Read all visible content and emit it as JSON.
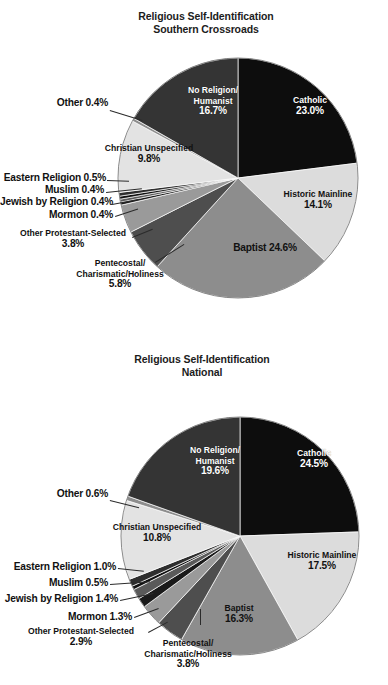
{
  "page": {
    "background": "#ffffff",
    "width": 388,
    "height": 685
  },
  "palette": {
    "catholic": "#0d0d0d",
    "historic_mainline": "#dcdcdc",
    "baptist": "#8d8d8d",
    "pentecostal": "#4e4e4e",
    "other_protestant": "#9a9a9a",
    "mormon": "#1a1a1a",
    "jewish": "#5a5a5a",
    "muslim": "#111111",
    "eastern": "#2e2e2e",
    "christian_unspecified": "#e3e3e3",
    "other": "#8d8d8d",
    "no_religion": "#343434",
    "text": "#111111",
    "leader_line": "#2b2b2b"
  },
  "charts": [
    {
      "id": "southern-crossroads",
      "title_line1": "Religious Self-Identification",
      "title_line2": "Southern Crossroads",
      "slices": [
        {
          "key": "catholic",
          "label": "Catholic",
          "value_text": "23.0%",
          "value": 23.0
        },
        {
          "key": "historic_mainline",
          "label": "Historic Mainline",
          "value_text": "14.1%",
          "value": 14.1
        },
        {
          "key": "baptist",
          "label": "Baptist",
          "value_text": "24.6%",
          "value": 24.6
        },
        {
          "key": "pentecostal",
          "label": "Pentecostal/ Charismatic/Holiness",
          "value_text": "5.8%",
          "value": 5.8
        },
        {
          "key": "other_protestant",
          "label": "Other Protestant-Selected",
          "value_text": "3.8%",
          "value": 3.8
        },
        {
          "key": "mormon",
          "label": "Mormon",
          "value_text": "0.4%",
          "value": 0.4
        },
        {
          "key": "jewish",
          "label": "Jewish by Religion",
          "value_text": "0.4%",
          "value": 0.4
        },
        {
          "key": "muslim",
          "label": "Muslim",
          "value_text": "0.4%",
          "value": 0.4
        },
        {
          "key": "eastern",
          "label": "Eastern Religion",
          "value_text": "0.5%",
          "value": 0.5
        },
        {
          "key": "christian_unspecified",
          "label": "Christian Unspecified",
          "value_text": "9.8%",
          "value": 9.8
        },
        {
          "key": "other",
          "label": "Other",
          "value_text": "0.4%",
          "value": 0.4
        },
        {
          "key": "no_religion",
          "label": "No Religion/ Humanist",
          "value_text": "16.7%",
          "value": 16.7
        }
      ],
      "labels": {
        "catholic_l1": "Catholic",
        "catholic_l2": "23.0%",
        "historic_l1": "Historic Mainline",
        "historic_l2": "14.1%",
        "baptist_inline": "Baptist 24.6%",
        "noreligion_l1": "No Religion/",
        "noreligion_l2": "Humanist",
        "noreligion_l3": "16.7%",
        "christian_l1": "Christian Unspecified",
        "christian_l2": "9.8%",
        "other_inline": "Other 0.4%",
        "eastern_inline": "Eastern Religion 0.5%",
        "muslim_inline": "Muslim 0.4%",
        "jewish_inline": "Jewish by Religion 0.4%",
        "mormon_inline": "Mormon 0.4%",
        "otherprot_l1": "Other Protestant-Selected",
        "otherprot_l2": "3.8%",
        "pentecostal_l1": "Pentecostal/",
        "pentecostal_l2": "Charismatic/Holiness",
        "pentecostal_l3": "5.8%"
      }
    },
    {
      "id": "national",
      "title_line1": "Religious Self-Identification",
      "title_line2": "National",
      "slices": [
        {
          "key": "catholic",
          "label": "Catholic",
          "value_text": "24.5%",
          "value": 24.5
        },
        {
          "key": "historic_mainline",
          "label": "Historic Mainline",
          "value_text": "17.5%",
          "value": 17.5
        },
        {
          "key": "baptist",
          "label": "Baptist",
          "value_text": "16.3%",
          "value": 16.3
        },
        {
          "key": "pentecostal",
          "label": "Pentecostal/ Charismatic/Holiness",
          "value_text": "3.8%",
          "value": 3.8
        },
        {
          "key": "other_protestant",
          "label": "Other Protestant-Selected",
          "value_text": "2.9%",
          "value": 2.9
        },
        {
          "key": "mormon",
          "label": "Mormon",
          "value_text": "1.3%",
          "value": 1.3
        },
        {
          "key": "jewish",
          "label": "Jewish by Religion",
          "value_text": "1.4%",
          "value": 1.4
        },
        {
          "key": "muslim",
          "label": "Muslim",
          "value_text": "0.5%",
          "value": 0.5
        },
        {
          "key": "eastern",
          "label": "Eastern Religion",
          "value_text": "1.0%",
          "value": 1.0
        },
        {
          "key": "christian_unspecified",
          "label": "Christian Unspecified",
          "value_text": "10.8%",
          "value": 10.8
        },
        {
          "key": "other",
          "label": "Other",
          "value_text": "0.6%",
          "value": 0.6
        },
        {
          "key": "no_religion",
          "label": "No Religion/ Humanist",
          "value_text": "19.6%",
          "value": 19.6
        }
      ],
      "labels": {
        "catholic_l1": "Catholic",
        "catholic_l2": "24.5%",
        "historic_l1": "Historic Mainline",
        "historic_l2": "17.5%",
        "baptist_l1": "Baptist",
        "baptist_l2": "16.3%",
        "noreligion_l1": "No Religion/",
        "noreligion_l2": "Humanist",
        "noreligion_l3": "19.6%",
        "christian_l1": "Christian Unspecified",
        "christian_l2": "10.8%",
        "other_inline": "Other 0.6%",
        "eastern_inline": "Eastern Religion  1.0%",
        "muslim_inline": "Muslim 0.5%",
        "jewish_inline": "Jewish by Religion 1.4%",
        "mormon_inline": "Mormon 1.3%",
        "otherprot_l1": "Other Protestant-Selected",
        "otherprot_l2": "2.9%",
        "pentecostal_l1": "Pentecostal/",
        "pentecostal_l2": "Charismatic/Holiness",
        "pentecostal_l3": "3.8%"
      }
    }
  ],
  "chart_data": [
    {
      "type": "pie",
      "title": "Religious Self-Identification Southern Crossroads",
      "subtitle": "Southern Crossroads",
      "unit": "percent",
      "legend": "none-labels-on-slices",
      "categories": [
        "Catholic",
        "Historic Mainline",
        "Baptist",
        "Pentecostal/Charismatic/Holiness",
        "Other Protestant-Selected",
        "Mormon",
        "Jewish by Religion",
        "Muslim",
        "Eastern Religion",
        "Christian Unspecified",
        "Other",
        "No Religion/Humanist"
      ],
      "values": [
        23.0,
        14.1,
        24.6,
        5.8,
        3.8,
        0.4,
        0.4,
        0.4,
        0.5,
        9.8,
        0.4,
        16.7
      ],
      "start_angle_deg": 0,
      "direction": "clockwise",
      "total": 100.0
    },
    {
      "type": "pie",
      "title": "Religious Self-Identification National",
      "subtitle": "National",
      "unit": "percent",
      "legend": "none-labels-on-slices",
      "categories": [
        "Catholic",
        "Historic Mainline",
        "Baptist",
        "Pentecostal/Charismatic/Holiness",
        "Other Protestant-Selected",
        "Mormon",
        "Jewish by Religion",
        "Muslim",
        "Eastern Religion",
        "Christian Unspecified",
        "Other",
        "No Religion/Humanist"
      ],
      "values": [
        24.5,
        17.5,
        16.3,
        3.8,
        2.9,
        1.3,
        1.4,
        0.5,
        1.0,
        10.8,
        0.6,
        19.6
      ],
      "start_angle_deg": 0,
      "direction": "clockwise",
      "total": 100.2
    }
  ]
}
